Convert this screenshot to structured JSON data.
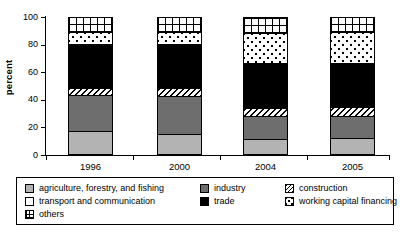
{
  "chart_data": {
    "type": "bar",
    "stacked": true,
    "title": "",
    "subtitle": "",
    "xlabel": "",
    "ylabel": "percent",
    "categories": [
      "1996",
      "2000",
      "2004",
      "2005"
    ],
    "ylim": [
      0,
      100
    ],
    "yticks": [
      0,
      20,
      40,
      60,
      80,
      100
    ],
    "ytick_labels": [
      "0",
      "20",
      "40",
      "60",
      "80",
      "100"
    ],
    "grid": false,
    "legend_position": "bottom",
    "units": "percent",
    "series": [
      {
        "name": "agriculture, forestry, and fishing",
        "pattern": "solid-light-gray",
        "color": "#b3b3b3",
        "values": [
          16,
          14,
          10,
          11
        ]
      },
      {
        "name": "industry",
        "pattern": "solid-dark-gray",
        "color": "#6e6e6e",
        "values": [
          27,
          28,
          17,
          16
        ]
      },
      {
        "name": "construction",
        "pattern": "diagonal-hatch",
        "color": "#ffffff",
        "values": [
          5,
          6,
          6,
          7
        ]
      },
      {
        "name": "trade",
        "pattern": "solid-black",
        "color": "#000000",
        "values": [
          32,
          32,
          33,
          32
        ]
      },
      {
        "name": "working capital financing",
        "pattern": "dotted",
        "color": "#ffffff",
        "values": [
          9,
          9,
          22,
          23
        ]
      },
      {
        "name": "others",
        "pattern": "grid-mesh",
        "color": "#ffffff",
        "values": [
          11,
          11,
          12,
          11
        ]
      }
    ]
  },
  "legend": {
    "items": [
      {
        "label": "agriculture, forestry, and fishing",
        "swatch": "solid-light-gray"
      },
      {
        "label": "industry",
        "swatch": "solid-dark-gray"
      },
      {
        "label": "construction",
        "swatch": "diagonal-hatch"
      },
      {
        "label": "transport and communication",
        "swatch": "white"
      },
      {
        "label": "trade",
        "swatch": "solid-black"
      },
      {
        "label": "working capital financing",
        "swatch": "dotted"
      },
      {
        "label": "others",
        "swatch": "grid-mesh"
      }
    ]
  },
  "colors": {
    "axis": "#000000",
    "agriculture": "#b3b3b3",
    "industry": "#6e6e6e",
    "trade": "#000000",
    "background": "#ffffff"
  }
}
